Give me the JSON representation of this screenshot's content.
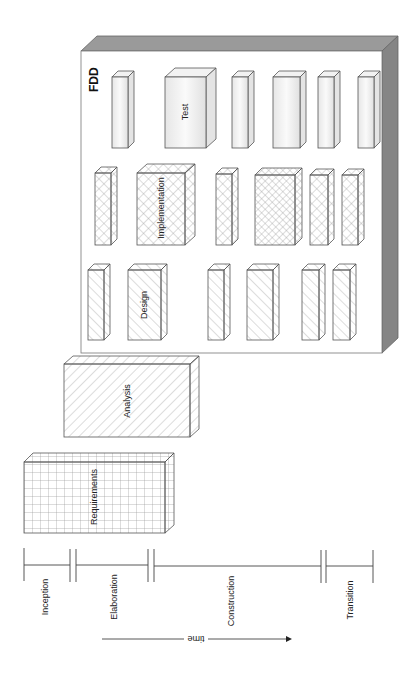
{
  "diagram": {
    "container": {
      "title": "FDD",
      "front_color": "#ffffff",
      "side_color": "#8a8a8a",
      "top_color": "#9a9a9a"
    },
    "rows": [
      {
        "name": "test",
        "pattern": "plain",
        "boxes": [
          {
            "label": ""
          },
          {
            "label": "Test"
          },
          {
            "label": ""
          },
          {
            "label": ""
          },
          {
            "label": ""
          },
          {
            "label": ""
          }
        ]
      },
      {
        "name": "implementation",
        "pattern": "crosshatch",
        "boxes": [
          {
            "label": ""
          },
          {
            "label": "Implementation"
          },
          {
            "label": ""
          },
          {
            "label": ""
          },
          {
            "label": ""
          },
          {
            "label": ""
          }
        ]
      },
      {
        "name": "design",
        "pattern": "diagonal",
        "boxes": [
          {
            "label": ""
          },
          {
            "label": "Design"
          },
          {
            "label": ""
          },
          {
            "label": ""
          },
          {
            "label": ""
          },
          {
            "label": ""
          }
        ]
      }
    ],
    "analysis": {
      "label": "Analysis",
      "pattern": "diagonal-back"
    },
    "requirements": {
      "label": "Requirements",
      "pattern": "grid"
    },
    "timeline": {
      "phases": [
        {
          "label": "Inception"
        },
        {
          "label": "Elaboration"
        },
        {
          "label": "Construction"
        },
        {
          "label": "Transition"
        }
      ],
      "arrow_label": "time"
    }
  }
}
